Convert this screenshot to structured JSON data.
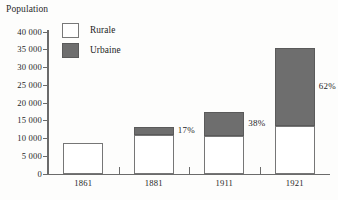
{
  "chart_data": {
    "type": "bar",
    "title": "",
    "ylabel": "Population",
    "xlabel": "",
    "categories": [
      "1861",
      "1881",
      "1911",
      "1921"
    ],
    "series": [
      {
        "name": "Rurale",
        "values": [
          8700,
          11000,
          10800,
          13500
        ]
      },
      {
        "name": "Urbaine",
        "values": [
          0,
          2200,
          6700,
          22000
        ]
      }
    ],
    "stacked": true,
    "ylim": [
      0,
      40000
    ],
    "ytick_labels": [
      "0",
      "5 000",
      "10 000",
      "15 000",
      "20 000",
      "25 000",
      "30 000",
      "35 000",
      "40 000"
    ],
    "ytick_values": [
      0,
      5000,
      10000,
      15000,
      20000,
      25000,
      30000,
      35000,
      40000
    ],
    "annotations": [
      {
        "text": "17%",
        "category": "1881"
      },
      {
        "text": "38%",
        "category": "1911"
      },
      {
        "text": "62%",
        "category": "1921"
      }
    ],
    "legend": {
      "position": "top-left-inside",
      "entries": [
        {
          "label": "Rurale",
          "color": "#ffffff"
        },
        {
          "label": "Urbaine",
          "color": "#6e6e6e"
        }
      ]
    },
    "grid": false,
    "colors": {
      "rurale": "#ffffff",
      "urbaine": "#6e6e6e",
      "axis": "#6b6b6b",
      "text": "#1f1f1f",
      "background": "#fdfdfc"
    }
  }
}
